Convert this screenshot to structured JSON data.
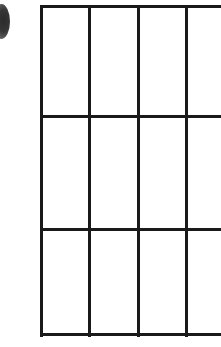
{
  "page": {
    "width": 221,
    "height": 347,
    "background_color": "#ffffff",
    "content_description": "Blank ruled grid / empty table form with a dark bullet marker clipped at the left edge"
  },
  "marker": {
    "name": "bullet-marker",
    "shape": "ellipse",
    "color": "#2b2b2b",
    "x": -7,
    "y": 4,
    "width": 17,
    "height": 35,
    "clipped_edge": "left"
  },
  "grid": {
    "line_color": "#1a1a1a",
    "line_thickness": 3,
    "cell_fill": "#ffffff",
    "left": 41,
    "top": 6,
    "bottom": 334,
    "clipped_edge": "right",
    "column_x": [
      41,
      89,
      138,
      186
    ],
    "row_y": [
      6,
      116,
      229,
      334
    ],
    "columns": 4,
    "rows": 3,
    "cells": [
      [
        "",
        "",
        "",
        ""
      ],
      [
        "",
        "",
        "",
        ""
      ],
      [
        "",
        "",
        "",
        ""
      ]
    ]
  }
}
